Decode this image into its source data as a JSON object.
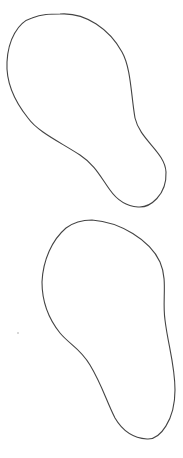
{
  "figure": {
    "shapes": [
      {
        "name": "upper-outline",
        "stroke": "#444444",
        "fill": "none"
      },
      {
        "name": "lower-outline",
        "stroke": "#444444",
        "fill": "none"
      }
    ],
    "background": "#ffffff",
    "caption": ""
  }
}
